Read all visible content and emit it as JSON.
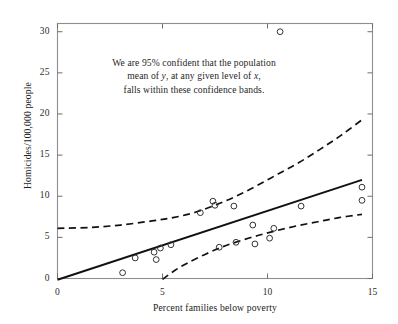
{
  "chart_data": {
    "type": "scatter",
    "title": "",
    "xlabel": "Percent families below poverty",
    "ylabel": "Homicides/100,000 people",
    "xlim": [
      0,
      15
    ],
    "ylim": [
      0,
      31
    ],
    "xticks": [
      0,
      5,
      10,
      15
    ],
    "yticks": [
      0,
      5,
      10,
      15,
      20,
      25,
      30
    ],
    "xtick_labels": [
      "0",
      "5",
      "10",
      "15"
    ],
    "ytick_labels": [
      "0",
      "5",
      "10",
      "15",
      "20",
      "25",
      "30"
    ],
    "grid": false,
    "legend": "none",
    "annotations": [
      {
        "lines": [
          "We are 95% confident that the population",
          "mean of y, at any given level of x,",
          "falls within these confidence bands."
        ],
        "line1_plain": "We are 95% confident that the population",
        "line2_pre": "mean of ",
        "line2_ital1": "y",
        "line2_mid": ", at any given level of ",
        "line2_ital2": "x",
        "line2_post": ",",
        "line3_plain": "falls within these confidence bands.",
        "x": 6.0,
        "y": 23.5
      }
    ],
    "marker": "open-circle",
    "marker_color": "#333333",
    "points": [
      {
        "x": 3.1,
        "y": 0.7
      },
      {
        "x": 3.7,
        "y": 2.5
      },
      {
        "x": 4.6,
        "y": 3.2
      },
      {
        "x": 4.7,
        "y": 2.3
      },
      {
        "x": 4.9,
        "y": 3.7
      },
      {
        "x": 5.4,
        "y": 4.1
      },
      {
        "x": 6.8,
        "y": 8.0
      },
      {
        "x": 7.4,
        "y": 9.4
      },
      {
        "x": 7.5,
        "y": 8.9
      },
      {
        "x": 7.7,
        "y": 3.8
      },
      {
        "x": 8.4,
        "y": 8.8
      },
      {
        "x": 8.5,
        "y": 4.4
      },
      {
        "x": 9.3,
        "y": 6.5
      },
      {
        "x": 9.4,
        "y": 4.2
      },
      {
        "x": 10.1,
        "y": 4.9
      },
      {
        "x": 10.3,
        "y": 6.1
      },
      {
        "x": 10.6,
        "y": 30.0
      },
      {
        "x": 11.6,
        "y": 8.8
      },
      {
        "x": 14.5,
        "y": 11.1
      },
      {
        "x": 14.5,
        "y": 9.5
      }
    ],
    "regression_line": {
      "name": "Least squares regression line",
      "style": "solid",
      "color": "#111111",
      "x_start": 0.0,
      "y_start": -0.15,
      "x_end": 14.5,
      "y_end": 12.0
    },
    "confidence_bands": {
      "name": "95% confidence bands for the mean",
      "style": "dashed",
      "color": "#111111",
      "level": "95%",
      "upper": [
        {
          "x": 0.0,
          "y": 6.1
        },
        {
          "x": 1.5,
          "y": 6.2
        },
        {
          "x": 3.0,
          "y": 6.5
        },
        {
          "x": 4.5,
          "y": 7.0
        },
        {
          "x": 5.5,
          "y": 7.4
        },
        {
          "x": 6.5,
          "y": 8.0
        },
        {
          "x": 7.5,
          "y": 8.9
        },
        {
          "x": 8.5,
          "y": 10.0
        },
        {
          "x": 9.5,
          "y": 11.3
        },
        {
          "x": 10.5,
          "y": 12.7
        },
        {
          "x": 11.5,
          "y": 14.1
        },
        {
          "x": 12.5,
          "y": 15.7
        },
        {
          "x": 13.5,
          "y": 17.4
        },
        {
          "x": 14.5,
          "y": 19.3
        }
      ],
      "lower": [
        {
          "x": 5.0,
          "y": -0.1
        },
        {
          "x": 5.6,
          "y": 1.0
        },
        {
          "x": 6.2,
          "y": 1.9
        },
        {
          "x": 7.0,
          "y": 2.9
        },
        {
          "x": 7.8,
          "y": 3.8
        },
        {
          "x": 8.6,
          "y": 4.5
        },
        {
          "x": 9.5,
          "y": 5.2
        },
        {
          "x": 10.4,
          "y": 5.8
        },
        {
          "x": 11.4,
          "y": 6.4
        },
        {
          "x": 12.4,
          "y": 6.9
        },
        {
          "x": 13.4,
          "y": 7.4
        },
        {
          "x": 14.5,
          "y": 7.8
        }
      ]
    }
  }
}
